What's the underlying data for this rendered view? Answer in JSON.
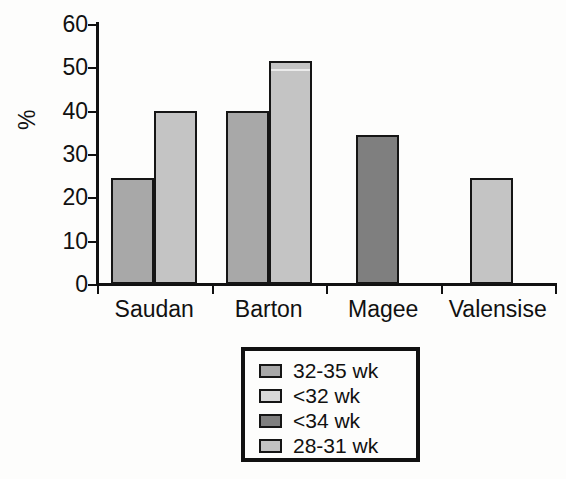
{
  "chart_data": {
    "type": "bar",
    "title": "",
    "xlabel": "",
    "ylabel": "%",
    "ylim": [
      0,
      60
    ],
    "yticks": [
      0,
      10,
      20,
      30,
      40,
      50,
      60
    ],
    "grid": false,
    "legend_position": "below-plot-center",
    "categories": [
      "Saudan",
      "Barton",
      "Magee",
      "Valensise"
    ],
    "series": [
      {
        "name": "32-35 wk",
        "color": "#a8a8a8",
        "values": [
          24.5,
          40.0,
          null,
          null
        ]
      },
      {
        "name": "<32 wk",
        "color": "#d4d4d4",
        "values": [
          40.0,
          51.5,
          null,
          null
        ]
      },
      {
        "name": "<34 wk",
        "color": "#7f7f7f",
        "values": [
          null,
          null,
          34.5,
          null
        ]
      },
      {
        "name": "28-31 wk",
        "color": "#c2c2c2",
        "values": [
          null,
          null,
          null,
          24.5
        ]
      }
    ],
    "bars": [
      {
        "category": "Saudan",
        "series": "32-35 wk",
        "value": 24.5,
        "color": "#a8a8a8"
      },
      {
        "category": "Saudan",
        "series": "<32 wk",
        "value": 40.0,
        "color": "#c4c4c4"
      },
      {
        "category": "Barton",
        "series": "32-35 wk",
        "value": 40.0,
        "color": "#a8a8a8"
      },
      {
        "category": "Barton",
        "series": "<32 wk",
        "value": 51.5,
        "color": "#c4c4c4"
      },
      {
        "category": "Magee",
        "series": "<34 wk",
        "value": 34.5,
        "color": "#7f7f7f"
      },
      {
        "category": "Valensise",
        "series": "28-31 wk",
        "value": 24.5,
        "color": "#c4c4c4"
      }
    ]
  },
  "axis": {
    "y_label": "%",
    "y_ticks": [
      "0",
      "10",
      "20",
      "30",
      "40",
      "50",
      "60"
    ]
  },
  "x_axis": {
    "labels": [
      "Saudan",
      "Barton",
      "Magee",
      "Valensise"
    ]
  },
  "legend": {
    "entries": [
      {
        "label": "32-35 wk",
        "color": "#a8a8a8"
      },
      {
        "label": "<32 wk",
        "color": "#d8d8d8"
      },
      {
        "label": "<34 wk",
        "color": "#7f7f7f"
      },
      {
        "label": "28-31 wk",
        "color": "#c2c2c2"
      }
    ]
  }
}
